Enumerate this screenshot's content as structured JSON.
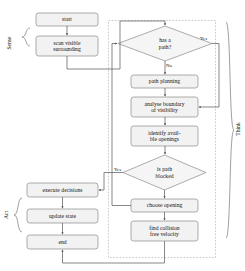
{
  "diagram": {
    "style": {
      "node_fill": "#f2f2f2",
      "node_stroke": "#808080",
      "edge_stroke": "#555555",
      "dashed_stroke": "#aaaaaa",
      "text_color": "#111111",
      "background": "#ffffff"
    },
    "groups": [
      {
        "id": "sense",
        "label": "Sense",
        "brace": "left",
        "orientation": "vertical"
      },
      {
        "id": "act",
        "label": "Act",
        "brace": "left",
        "orientation": "vertical"
      },
      {
        "id": "think",
        "label": "Think",
        "brace": "right",
        "orientation": "vertical",
        "boundary": "dashed"
      }
    ],
    "nodes": [
      {
        "id": "start",
        "shape": "rounded-rect",
        "lines": [
          "start"
        ],
        "group": "sense"
      },
      {
        "id": "scan",
        "shape": "rounded-rect",
        "lines": [
          "scan visible",
          "surrounding"
        ],
        "group": "sense"
      },
      {
        "id": "has-path",
        "shape": "diamond",
        "lines": [
          "has a",
          "path?"
        ],
        "group": "think"
      },
      {
        "id": "path-planning",
        "shape": "rounded-rect",
        "lines": [
          "path planning"
        ],
        "group": "think"
      },
      {
        "id": "analyse-boundary",
        "shape": "rounded-rect",
        "lines": [
          "analyse boundary",
          "of visibility"
        ],
        "group": "think"
      },
      {
        "id": "identify-openings",
        "shape": "rounded-rect",
        "lines": [
          "identify avail-",
          "ble openings"
        ],
        "group": "think"
      },
      {
        "id": "is-path-blocked",
        "shape": "diamond",
        "lines": [
          "is path",
          "blocked"
        ],
        "group": "think"
      },
      {
        "id": "choose-opening",
        "shape": "rounded-rect",
        "lines": [
          "choose opening"
        ],
        "group": "think"
      },
      {
        "id": "find-velocity",
        "shape": "rounded-rect",
        "lines": [
          "find collision",
          "free velocity"
        ],
        "group": "think"
      },
      {
        "id": "execute-decisions",
        "shape": "rounded-rect",
        "lines": [
          "execute decisions"
        ],
        "group": "act"
      },
      {
        "id": "update-state",
        "shape": "rounded-rect",
        "lines": [
          "update state"
        ],
        "group": "act"
      },
      {
        "id": "end",
        "shape": "rounded-rect",
        "lines": [
          "end"
        ],
        "group": "act"
      }
    ],
    "edge_labels": [
      {
        "id": "has-path-yes",
        "text": "Yes",
        "from": "has-path",
        "to": "analyse-boundary"
      },
      {
        "id": "has-path-no",
        "text": "No",
        "from": "has-path",
        "to": "path-planning"
      },
      {
        "id": "blocked-yes",
        "text": "Yes",
        "from": "is-path-blocked",
        "to": "execute-decisions"
      }
    ],
    "edges": [
      {
        "from": "start",
        "to": "scan"
      },
      {
        "from": "scan",
        "to": "has-path"
      },
      {
        "from": "has-path",
        "to": "path-planning",
        "label": "No"
      },
      {
        "from": "has-path",
        "to": "analyse-boundary",
        "label": "Yes"
      },
      {
        "from": "path-planning",
        "to": "analyse-boundary"
      },
      {
        "from": "analyse-boundary",
        "to": "identify-openings"
      },
      {
        "from": "identify-openings",
        "to": "is-path-blocked"
      },
      {
        "from": "is-path-blocked",
        "to": "choose-opening",
        "label": "No"
      },
      {
        "from": "is-path-blocked",
        "to": "execute-decisions",
        "label": "Yes"
      },
      {
        "from": "choose-opening",
        "to": "find-velocity"
      },
      {
        "from": "find-velocity",
        "to": "execute-decisions"
      },
      {
        "from": "execute-decisions",
        "to": "update-state"
      },
      {
        "from": "update-state",
        "to": "end"
      },
      {
        "from": "choose-opening",
        "to": "has-path",
        "type": "feedback"
      }
    ]
  }
}
